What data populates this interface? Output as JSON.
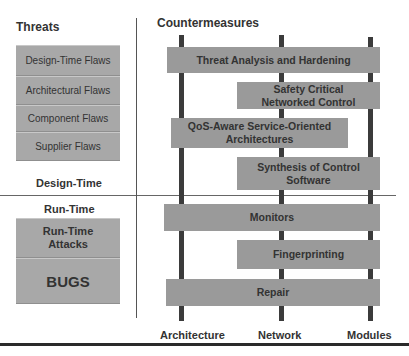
{
  "left_panel": {
    "title": "Threats",
    "design_time_threats": [
      "Design-Time Flaws",
      "Architectural Flaws",
      "Component Flaws",
      "Supplier Flaws"
    ],
    "design_time_label": "Design-Time",
    "run_time_label": "Run-Time",
    "run_time_threats": [
      "Run-Time Attacks",
      "BUGS"
    ]
  },
  "right_panel": {
    "title": "Countermeasures",
    "countermeasures": [
      {
        "label": "Threat Analysis and Hardening",
        "span": "Architecture to Modules"
      },
      {
        "label": "Safety Critical Networked Control",
        "span": "Network to Modules"
      },
      {
        "label": "QoS-Aware Service-Oriented Architectures",
        "span": "Architecture to between Network and Modules"
      },
      {
        "label": "Synthesis of Control Software",
        "span": "Network to Modules"
      },
      {
        "label": "Monitors",
        "span": "Architecture to Modules"
      },
      {
        "label": "Fingerprinting",
        "span": "Network to Modules"
      },
      {
        "label": "Repair",
        "span": "Architecture to Modules"
      }
    ],
    "axis_labels": [
      "Architecture",
      "Network",
      "Modules"
    ]
  }
}
